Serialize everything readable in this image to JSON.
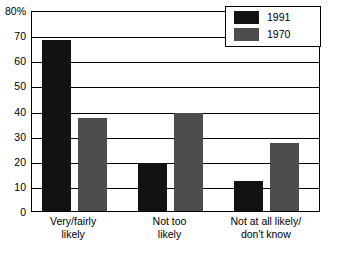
{
  "chart_data": {
    "type": "bar",
    "title": "",
    "xlabel": "",
    "ylabel": "",
    "ylim": [
      0,
      80
    ],
    "ytick_values": [
      0,
      10,
      20,
      30,
      40,
      50,
      60,
      70,
      80
    ],
    "ytick_labels": [
      "0",
      "10",
      "20",
      "30",
      "40",
      "50",
      "60",
      "70",
      "80%"
    ],
    "grid": true,
    "legend_position": "top-right-inside",
    "categories": [
      "Very/fairly likely",
      "Not too likely",
      "Not at all likely/ don't know"
    ],
    "category_lines": [
      [
        "Very/fairly",
        "likely"
      ],
      [
        "Not too",
        "likely"
      ],
      [
        "Not at all likely/",
        "don't know"
      ]
    ],
    "series": [
      {
        "name": "1991",
        "color": "#121212",
        "values": [
          68,
          19,
          12
        ]
      },
      {
        "name": "1970",
        "color": "#4d4d4d",
        "values": [
          37,
          39,
          27
        ]
      }
    ]
  },
  "legend": {
    "entries": [
      {
        "label": "1991"
      },
      {
        "label": "1970"
      }
    ]
  }
}
